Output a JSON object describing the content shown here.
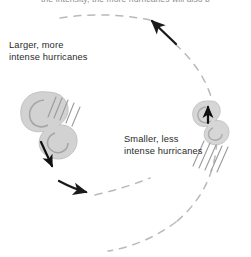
{
  "figure": {
    "name": "hurricane-intensity-cycle",
    "background_color": "#ffffff",
    "width": 251,
    "height": 257,
    "top_caption": "the intensity, the more hurricanes will also b",
    "labels": {
      "left": "Larger, more\nintense hurricanes",
      "right": "Smaller, less\nintense hurricanes"
    },
    "colors": {
      "text": "#2a2a2a",
      "caption_text": "#8d8d8d",
      "dashed_loop": "#b9b9b9",
      "solid_arrow": "#1a1a1a",
      "storm_fill": "#cfcfcf",
      "storm_shade": "#a8a8a8",
      "hatch": "#9a9a9a"
    },
    "elements": [
      {
        "name": "dashed-loop",
        "type": "ellipse-path",
        "style": "dashed",
        "direction": "counter-clockwise"
      },
      {
        "name": "top-arrow",
        "type": "arrow",
        "points_to": "upper-left"
      },
      {
        "name": "bottom-arrow",
        "type": "arrow",
        "points_to": "right"
      },
      {
        "name": "left-storm",
        "type": "hurricane-swirl",
        "size": "large"
      },
      {
        "name": "right-storm",
        "type": "hurricane-swirl",
        "size": "small"
      },
      {
        "name": "left-storm-arrow",
        "type": "arrow",
        "points_to": "down-left"
      },
      {
        "name": "right-storm-arrow",
        "type": "arrow",
        "points_to": "up"
      }
    ]
  }
}
